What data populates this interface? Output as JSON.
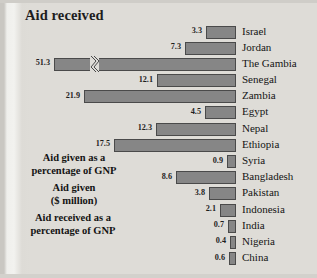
{
  "title": "Aid received",
  "annotations": [
    "Aid given as a\npercentage of GNP",
    "Aid given\n($ million)",
    "Aid received as a\npercentage of GNP"
  ],
  "annotation_lines": [
    [
      "Aid given as a",
      "percentage of GNP"
    ],
    [
      "Aid given",
      "($ million)"
    ],
    [
      "Aid received as a",
      "percentage of GNP"
    ]
  ],
  "colors": {
    "bar_fill": "#868686",
    "bar_stroke": "#4a4a4a",
    "page": "#dedcd7",
    "text": "#1d1d1d"
  },
  "chart_data": {
    "type": "bar",
    "orientation": "horizontal-right-aligned",
    "title": "Aid received",
    "xlabel": "",
    "ylabel": "",
    "value_suffix": "",
    "axis_break": {
      "category": "The Gambia",
      "note": "bar truncated with zig-zag break"
    },
    "xlim": [
      0,
      24
    ],
    "grid": false,
    "legend": "none",
    "categories": [
      "Israel",
      "Jordan",
      "The Gambia",
      "Senegal",
      "Zambia",
      "Egypt",
      "Nepal",
      "Ethiopia",
      "Syria",
      "Bangladesh",
      "Pakistan",
      "Indonesia",
      "India",
      "Nigeria",
      "China"
    ],
    "values": [
      3.3,
      7.3,
      51.3,
      12.1,
      21.9,
      4.5,
      12.3,
      17.5,
      0.9,
      8.6,
      3.8,
      2.1,
      0.7,
      0.4,
      0.6
    ],
    "bars": [
      {
        "country": "Israel",
        "value": 3.3,
        "label": "3.3",
        "bar_px": 30,
        "break": false
      },
      {
        "country": "Jordan",
        "value": 7.3,
        "label": "7.3",
        "bar_px": 51,
        "break": false
      },
      {
        "country": "The Gambia",
        "value": 51.3,
        "label": "51.3",
        "bar_px": 182,
        "break": true
      },
      {
        "country": "Senegal",
        "value": 12.1,
        "label": "12.1",
        "bar_px": 79,
        "break": false
      },
      {
        "country": "Zambia",
        "value": 21.9,
        "label": "21.9",
        "bar_px": 152,
        "break": false
      },
      {
        "country": "Egypt",
        "value": 4.5,
        "label": "4.5",
        "bar_px": 31,
        "break": false
      },
      {
        "country": "Nepal",
        "value": 12.3,
        "label": "12.3",
        "bar_px": 80,
        "break": false
      },
      {
        "country": "Ethiopia",
        "value": 17.5,
        "label": "17.5",
        "bar_px": 122,
        "break": false
      },
      {
        "country": "Syria",
        "value": 0.9,
        "label": "0.9",
        "bar_px": 9,
        "break": false
      },
      {
        "country": "Bangladesh",
        "value": 8.6,
        "label": "8.6",
        "bar_px": 60,
        "break": false
      },
      {
        "country": "Pakistan",
        "value": 3.8,
        "label": "3.8",
        "bar_px": 27,
        "break": false
      },
      {
        "country": "Indonesia",
        "value": 2.1,
        "label": "2.1",
        "bar_px": 16,
        "break": false
      },
      {
        "country": "India",
        "value": 0.7,
        "label": "0.7",
        "bar_px": 8,
        "break": false
      },
      {
        "country": "Nigeria",
        "value": 0.4,
        "label": "0.4",
        "bar_px": 6,
        "break": false
      },
      {
        "country": "China",
        "value": 0.6,
        "label": "0.6",
        "bar_px": 7,
        "break": false
      }
    ]
  }
}
